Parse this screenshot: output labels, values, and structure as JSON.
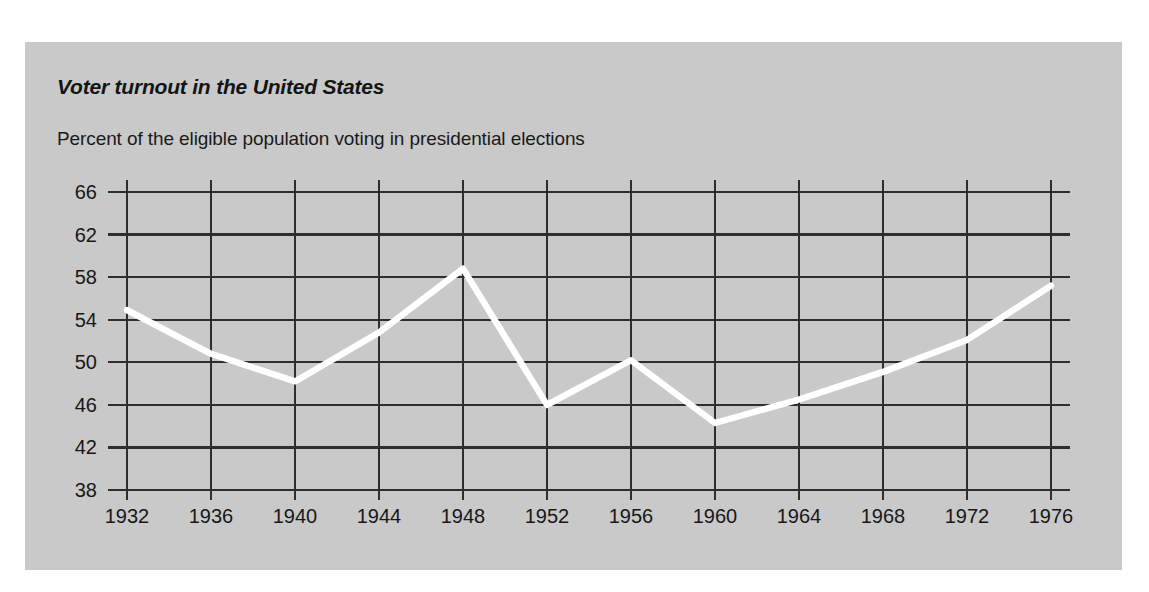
{
  "figure": {
    "background_color": "#c9c9c9",
    "page_color": "#ffffff",
    "title": "Voter turnout in the United States",
    "subtitle": "Percent of the eligible population voting in presidential elections"
  },
  "chart_data": {
    "type": "line",
    "title": "Voter turnout in the United States",
    "subtitle": "Percent of the eligible population voting in presidential elections",
    "xlabel": "",
    "ylabel": "",
    "x": [
      1932,
      1936,
      1940,
      1944,
      1948,
      1952,
      1956,
      1960,
      1964,
      1968,
      1972,
      1976
    ],
    "categories": [
      "1932",
      "1936",
      "1940",
      "1944",
      "1948",
      "1952",
      "1956",
      "1960",
      "1964",
      "1968",
      "1972",
      "1976"
    ],
    "values": [
      54.9,
      50.8,
      48.2,
      52.8,
      58.8,
      46.0,
      50.2,
      44.3,
      46.5,
      49.1,
      52.1,
      57.2
    ],
    "series": [
      {
        "name": "Percent of eligible population voting",
        "color": "#ffffff",
        "values": [
          54.9,
          50.8,
          48.2,
          52.8,
          58.8,
          46.0,
          50.2,
          44.3,
          46.5,
          49.1,
          52.1,
          57.2
        ]
      }
    ],
    "xlim": [
      1932,
      1976
    ],
    "ylim": [
      38,
      66
    ],
    "xticks": [
      "1932",
      "1936",
      "1940",
      "1944",
      "1948",
      "1952",
      "1956",
      "1960",
      "1964",
      "1968",
      "1972",
      "1976"
    ],
    "yticks": [
      "38",
      "42",
      "46",
      "50",
      "54",
      "58",
      "62",
      "66"
    ],
    "ytick_values": [
      38,
      42,
      46,
      50,
      54,
      58,
      62,
      66
    ],
    "grid": true,
    "grid_color": "#2e2e2e",
    "legend": "none",
    "line_color": "#ffffff"
  }
}
